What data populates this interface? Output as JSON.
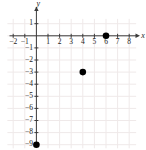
{
  "chart_data": {
    "type": "scatter",
    "title": "",
    "xlabel": "x",
    "ylabel": "y",
    "x_ticks": [
      -2,
      -1,
      1,
      2,
      3,
      4,
      5,
      6,
      7,
      8
    ],
    "y_ticks": [
      1,
      -1,
      -2,
      -3,
      -4,
      -5,
      -6,
      -7,
      -8,
      -9
    ],
    "points": [
      [
        6,
        0
      ],
      [
        4,
        -3
      ],
      [
        0,
        -9
      ]
    ],
    "xlim": [
      -2.5,
      8.6
    ],
    "ylim": [
      -9.3,
      1.4
    ],
    "grid": true,
    "legend": false,
    "colors": {
      "point": "#000000",
      "axis": "#3b3b3b",
      "grid": "#efe9e9",
      "label": "#222222"
    }
  }
}
